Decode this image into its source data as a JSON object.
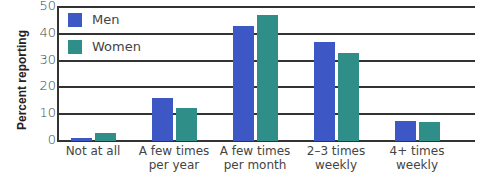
{
  "chart_data": {
    "type": "bar",
    "title": "",
    "xlabel": "",
    "ylabel": "Percent reporting",
    "ylim": [
      0,
      50
    ],
    "yticks": [
      0,
      10,
      20,
      30,
      40,
      50
    ],
    "grid": true,
    "legend_position": "top-left inside",
    "categories": [
      "Not at all",
      "A few times per year",
      "A few times per month",
      "2–3 times weekly",
      "4+ times weekly"
    ],
    "category_lines": [
      [
        "Not at all"
      ],
      [
        "A few times",
        "per year"
      ],
      [
        "A few times",
        "per month"
      ],
      [
        "2–3 times",
        "weekly"
      ],
      [
        "4+ times",
        "weekly"
      ]
    ],
    "series": [
      {
        "name": "Men",
        "color": "#3d57c4",
        "values": [
          1,
          16,
          43,
          37,
          7.5
        ]
      },
      {
        "name": "Women",
        "color": "#2f8f88",
        "values": [
          3,
          12.5,
          47,
          33,
          7
        ]
      }
    ]
  },
  "legend": {
    "men": "Men",
    "women": "Women"
  },
  "axis": {
    "ylabel": "Percent reporting",
    "ticks": [
      "0",
      "10",
      "20",
      "30",
      "40",
      "50"
    ]
  }
}
